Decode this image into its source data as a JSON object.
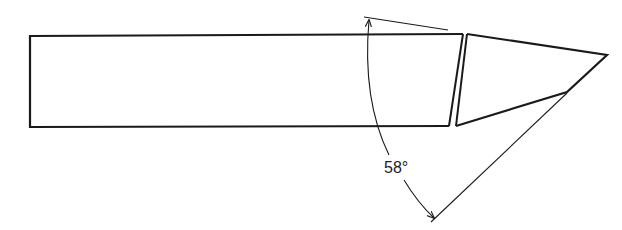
{
  "diagram": {
    "type": "technical-drawing",
    "angle_label": "58°",
    "colors": {
      "stroke": "#1a1a1a",
      "background": "#ffffff"
    }
  }
}
